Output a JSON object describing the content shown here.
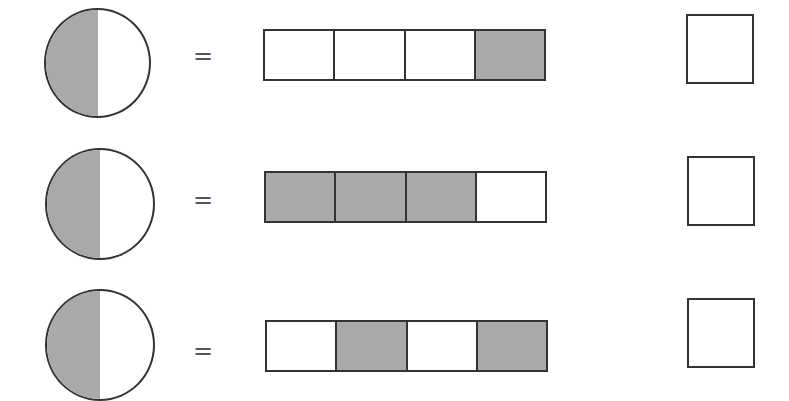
{
  "equals_symbol": "=",
  "shade_color": "#a9a9a9",
  "rows": [
    {
      "circle": {
        "shaded_fraction": "1/2"
      },
      "bar": {
        "cells": [
          false,
          false,
          false,
          true
        ]
      },
      "answer": ""
    },
    {
      "circle": {
        "shaded_fraction": "1/2"
      },
      "bar": {
        "cells": [
          true,
          true,
          true,
          false
        ]
      },
      "answer": ""
    },
    {
      "circle": {
        "shaded_fraction": "1/2"
      },
      "bar": {
        "cells": [
          false,
          true,
          false,
          true
        ]
      },
      "answer": ""
    }
  ]
}
